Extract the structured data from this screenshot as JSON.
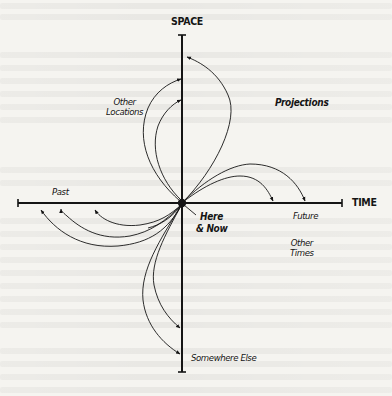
{
  "diagram": {
    "axes": {
      "vertical": {
        "label": "SPACE"
      },
      "horizontal": {
        "label": "TIME"
      }
    },
    "center": {
      "label_line1": "Here",
      "label_line2": "& Now"
    },
    "labels": {
      "other_locations_line1": "Other",
      "other_locations_line2": "Locations",
      "projections": "Projections",
      "past": "Past",
      "future": "Future",
      "other_times_line1": "Other",
      "other_times_line2": "Times",
      "somewhere_else": "Somewhere Else"
    },
    "geometry": {
      "origin": [
        182,
        203
      ],
      "space_axis": {
        "x": 182,
        "y_top": 35,
        "y_bottom": 372
      },
      "time_axis": {
        "y": 203,
        "x_left": 18,
        "x_right": 342
      },
      "arrows": [
        {
          "group": "space-up",
          "target": [
            186,
            57
          ]
        },
        {
          "group": "space-up",
          "target": [
            181,
            79
          ]
        },
        {
          "group": "space-up",
          "target": [
            181,
            100
          ]
        },
        {
          "group": "time-future",
          "target": [
            273,
            202
          ]
        },
        {
          "group": "time-future",
          "target": [
            305,
            202
          ]
        },
        {
          "group": "time-past",
          "target": [
            40,
            209
          ]
        },
        {
          "group": "time-past",
          "target": [
            61,
            209
          ]
        },
        {
          "group": "time-past",
          "target": [
            94,
            209
          ]
        },
        {
          "group": "space-down",
          "target": [
            180,
            328
          ]
        },
        {
          "group": "space-down",
          "target": [
            180,
            354
          ]
        }
      ]
    },
    "colors": {
      "ink": "#151515",
      "paper": "#f5f4f0"
    }
  }
}
